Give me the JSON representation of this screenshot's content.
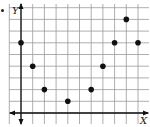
{
  "chart_data": {
    "type": "scatter",
    "title": "",
    "xlabel": "X",
    "ylabel": "Y",
    "grid": true,
    "x": [
      0,
      1,
      2,
      4,
      6,
      7,
      8,
      9,
      10
    ],
    "y": [
      6,
      4,
      2,
      1,
      2,
      4,
      6,
      8,
      6
    ],
    "xlim": [
      -1,
      11
    ],
    "ylim": [
      -1,
      9
    ],
    "axis_style": "arrows on both ends, no tick labels",
    "colors": {
      "points": "#111111",
      "grid": "#9a9a9a",
      "axes": "#111111"
    }
  },
  "labels": {
    "x_axis": "X",
    "y_axis": "Y"
  }
}
